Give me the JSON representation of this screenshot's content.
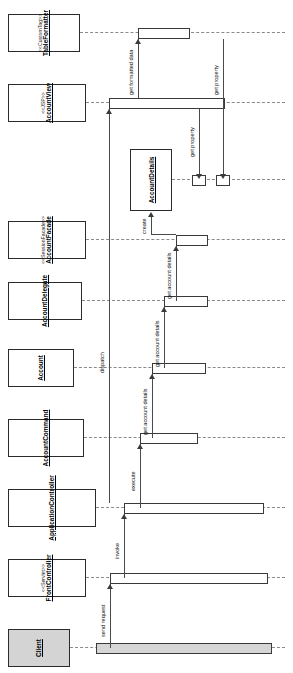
{
  "diagram": {
    "kind": "uml-sequence-diagram",
    "orientation": "rotated-90-ccw",
    "lifelines": [
      {
        "id": "client",
        "stereotype": "",
        "name": "Client",
        "shaded": true,
        "underline": true
      },
      {
        "id": "front-controller",
        "stereotype": "<<Servlet>>",
        "name": "FrontController",
        "shaded": false,
        "underline": true
      },
      {
        "id": "application-controller",
        "stereotype": "",
        "name": "ApplicationController",
        "shaded": false,
        "underline": true
      },
      {
        "id": "account-command",
        "stereotype": "",
        "name": "AccountCommand",
        "shaded": false,
        "underline": true
      },
      {
        "id": "account",
        "stereotype": "",
        "name": "Account",
        "shaded": false,
        "underline": true
      },
      {
        "id": "account-delegate",
        "stereotype": "",
        "name": "AccountDelegate",
        "shaded": false,
        "underline": true
      },
      {
        "id": "account-facade",
        "stereotype": "<<SessionFacade>>",
        "name": "AccountFacade",
        "shaded": false,
        "underline": true
      },
      {
        "id": "account-view",
        "stereotype": "<<JSP>>",
        "name": "AccountView",
        "shaded": false,
        "underline": true
      },
      {
        "id": "table-formatter",
        "stereotype": "<<CustomTag>>",
        "name": "TableFormatter",
        "shaded": false,
        "underline": true
      }
    ],
    "created_objects": [
      {
        "id": "account-details",
        "name": "AccountDetails"
      }
    ],
    "messages": [
      {
        "id": "m1",
        "label": "send request",
        "from": "client",
        "to": "front-controller"
      },
      {
        "id": "m2",
        "label": "invoke",
        "from": "front-controller",
        "to": "application-controller"
      },
      {
        "id": "m3",
        "label": "execute",
        "from": "application-controller",
        "to": "account-command"
      },
      {
        "id": "m4",
        "label": "get account details",
        "from": "account-command",
        "to": "account"
      },
      {
        "id": "m5",
        "label": "get account details",
        "from": "account",
        "to": "account-delegate"
      },
      {
        "id": "m6",
        "label": "get account details",
        "from": "account-delegate",
        "to": "account-facade"
      },
      {
        "id": "m7",
        "label": "create",
        "from": "account-facade",
        "to": "account-details"
      },
      {
        "id": "m8",
        "label": "dispatch",
        "from": "application-controller",
        "to": "account-view"
      },
      {
        "id": "m9",
        "label": "get property",
        "from": "account-view",
        "to": "account-details"
      },
      {
        "id": "m10",
        "label": "get formatted data",
        "from": "account-view",
        "to": "table-formatter"
      },
      {
        "id": "m11",
        "label": "get property",
        "from": "table-formatter",
        "to": "account-details"
      }
    ],
    "colors": {
      "background": "#ffffff",
      "line": "#3a3a3a",
      "lifeline": "#8a8a8a",
      "actor_fill": "#d4d4d4",
      "activation_fill": "#ffffff"
    }
  }
}
